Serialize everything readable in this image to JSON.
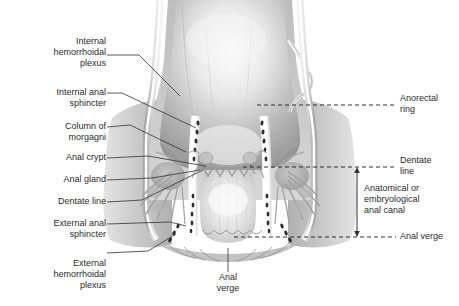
{
  "figure": {
    "type": "anatomical-illustration",
    "style": "grayscale shaded medical drawing",
    "colors": {
      "background": "#ffffff",
      "text": "#2b2b2b",
      "leader_line": "#3c3c3c",
      "dashed_line": "#2f2f2f",
      "tissue_light": "#f2f2f2",
      "tissue_mid": "#c9c9c9",
      "tissue_dark": "#8e8e8e",
      "lumen_dark": "#9a9a9a",
      "muscle_speckle": "#2e2e2e"
    }
  },
  "labels_left": [
    {
      "id": "internal-hemorrhoidal-plexus",
      "text": "Internal\nhemorrhoidal\nplexus",
      "lines": 3
    },
    {
      "id": "internal-anal-sphincter",
      "text": "Internal anal\nsphincter",
      "lines": 2
    },
    {
      "id": "column-of-morgagni",
      "text": "Column of\nmorgagni",
      "lines": 2
    },
    {
      "id": "anal-crypt",
      "text": "Anal crypt",
      "lines": 1
    },
    {
      "id": "anal-gland",
      "text": "Anal gland",
      "lines": 1
    },
    {
      "id": "dentate-line-left",
      "text": "Dentate line",
      "lines": 1
    },
    {
      "id": "external-anal-sphincter",
      "text": "External anal\nsphincter",
      "lines": 2
    },
    {
      "id": "external-hemorrhoidal-plexus",
      "text": "External\nhemorrhoidal\nplexus",
      "lines": 3
    }
  ],
  "labels_right": [
    {
      "id": "anorectal-ring",
      "text": "Anorectal\nring",
      "lines": 2
    },
    {
      "id": "dentate-line-right",
      "text": "Dentate\nline",
      "lines": 2
    },
    {
      "id": "anatomical-anal-canal",
      "text": "Anatomical or\nembryological\nanal canal",
      "lines": 3
    },
    {
      "id": "anal-verge-right",
      "text": "Anal verge",
      "lines": 1
    }
  ],
  "labels_bottom": [
    {
      "id": "anal-verge-bottom",
      "text": "Anal\nverge",
      "lines": 2
    }
  ],
  "measurement": {
    "id": "anal-canal-span",
    "description": "Double-headed vertical arrow spanning the anatomical or embryological anal canal",
    "from": "Dentate line",
    "to": "Anal verge"
  }
}
